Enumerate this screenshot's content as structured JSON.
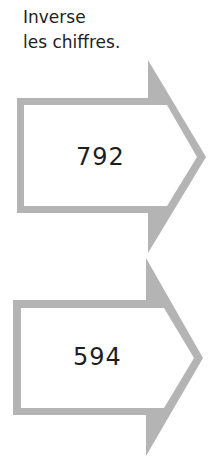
{
  "instruction": {
    "line1": "Inverse",
    "line2": "les chiffres."
  },
  "arrows": [
    {
      "value": "792"
    },
    {
      "value": "594"
    }
  ],
  "colors": {
    "arrow_border": "#b4b4b4",
    "text": "#222222"
  }
}
